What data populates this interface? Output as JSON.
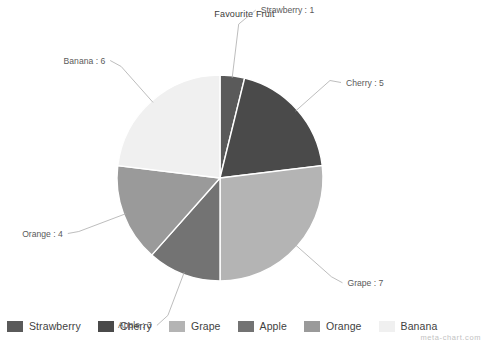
{
  "chart_data": {
    "type": "pie",
    "title": "Favourite Fruit",
    "xlabel": "",
    "ylabel": "",
    "total": 26,
    "grid": false,
    "legend_position": "bottom",
    "start_angle_deg": 0,
    "direction": "clockwise",
    "categories": [
      "Strawberry",
      "Cherry",
      "Grape",
      "Apple",
      "Orange",
      "Banana"
    ],
    "values": [
      1,
      5,
      7,
      3,
      4,
      6
    ],
    "slices": [
      {
        "label": "Strawberry",
        "value": 1,
        "callout": "Strawberry : 1",
        "color": "#5a5a5a"
      },
      {
        "label": "Cherry",
        "value": 5,
        "callout": "Cherry : 5",
        "color": "#4a4a4a"
      },
      {
        "label": "Grape",
        "value": 7,
        "callout": "Grape : 7",
        "color": "#b4b4b4"
      },
      {
        "label": "Apple",
        "value": 3,
        "callout": "Apple : 3",
        "color": "#737373"
      },
      {
        "label": "Orange",
        "value": 4,
        "callout": "Orange : 4",
        "color": "#9a9a9a"
      },
      {
        "label": "Banana",
        "value": 6,
        "callout": "Banana : 6",
        "color": "#f0f0f0"
      }
    ],
    "annotations": [
      "meta-chart.com"
    ]
  },
  "legend": {
    "items": [
      {
        "label": "Strawberry",
        "color": "#5a5a5a"
      },
      {
        "label": "Cherry",
        "color": "#4a4a4a"
      },
      {
        "label": "Grape",
        "color": "#b4b4b4"
      },
      {
        "label": "Apple",
        "color": "#737373"
      },
      {
        "label": "Orange",
        "color": "#9a9a9a"
      },
      {
        "label": "Banana",
        "color": "#f0f0f0"
      }
    ]
  },
  "watermark": {
    "text": "meta-chart.com"
  }
}
